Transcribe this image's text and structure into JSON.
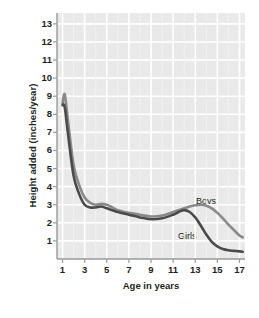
{
  "chart_data": {
    "type": "line",
    "title": "",
    "xlabel": "Age in years",
    "ylabel": "Height added (inches/year)",
    "xlim": [
      0.5,
      17.5
    ],
    "ylim": [
      0,
      13.6
    ],
    "xticks": [
      1,
      3,
      5,
      7,
      9,
      11,
      13,
      15,
      17
    ],
    "yticks": [
      1,
      2,
      3,
      4,
      5,
      6,
      7,
      8,
      9,
      10,
      11,
      12,
      13
    ],
    "grid": true,
    "legend_position": "inline-annotation",
    "panel_color": "#e9e9e9",
    "gridline_color": "#ffffff",
    "series": [
      {
        "name": "Boys",
        "color": "#8a8a8a",
        "x": [
          1.0,
          1.2,
          1.5,
          2.0,
          2.5,
          3.0,
          3.5,
          4.0,
          4.5,
          5.0,
          5.5,
          6.0,
          7.0,
          8.0,
          9.0,
          10.0,
          11.0,
          11.5,
          12.0,
          12.5,
          13.0,
          13.5,
          14.0,
          14.5,
          15.0,
          15.5,
          16.0,
          16.5,
          17.0,
          17.3
        ],
        "values": [
          8.6,
          9.1,
          7.6,
          5.2,
          4.1,
          3.4,
          3.1,
          3.0,
          3.05,
          3.0,
          2.85,
          2.7,
          2.55,
          2.45,
          2.35,
          2.4,
          2.6,
          2.7,
          2.8,
          2.9,
          2.97,
          3.0,
          2.95,
          2.8,
          2.55,
          2.25,
          1.9,
          1.6,
          1.3,
          1.2
        ]
      },
      {
        "name": "Girls",
        "color": "#4a4a4a",
        "x": [
          1.0,
          1.2,
          1.5,
          2.0,
          2.5,
          3.0,
          3.5,
          4.0,
          4.5,
          5.0,
          5.5,
          6.0,
          7.0,
          8.0,
          9.0,
          10.0,
          11.0,
          11.5,
          12.0,
          12.5,
          13.0,
          13.5,
          14.0,
          14.5,
          15.0,
          15.5,
          16.0,
          16.5,
          17.0,
          17.3
        ],
        "values": [
          8.5,
          8.4,
          6.9,
          4.6,
          3.6,
          3.0,
          2.85,
          2.85,
          2.9,
          2.8,
          2.7,
          2.6,
          2.45,
          2.3,
          2.2,
          2.25,
          2.45,
          2.6,
          2.7,
          2.6,
          2.3,
          1.85,
          1.35,
          0.95,
          0.7,
          0.55,
          0.48,
          0.45,
          0.42,
          0.4
        ]
      }
    ],
    "annotations": [
      {
        "text": "Boys",
        "x": 14.3,
        "y": 3.9
      },
      {
        "text": "Girls",
        "x": 12.4,
        "y": 1.85
      }
    ]
  }
}
